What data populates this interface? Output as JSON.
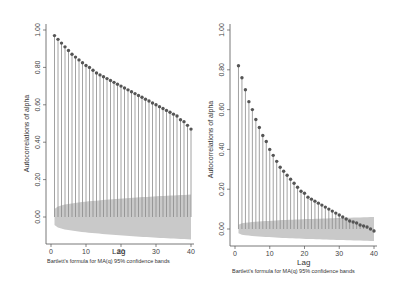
{
  "chart_data": [
    {
      "type": "bar",
      "subtype": "stem (correlogram)",
      "x": [
        1,
        2,
        3,
        4,
        5,
        6,
        7,
        8,
        9,
        10,
        11,
        12,
        13,
        14,
        15,
        16,
        17,
        18,
        19,
        20,
        21,
        22,
        23,
        24,
        25,
        26,
        27,
        28,
        29,
        30,
        31,
        32,
        33,
        34,
        35,
        36,
        37,
        38,
        39,
        40
      ],
      "values": [
        0.97,
        0.95,
        0.93,
        0.91,
        0.89,
        0.87,
        0.855,
        0.84,
        0.825,
        0.81,
        0.8,
        0.785,
        0.77,
        0.76,
        0.75,
        0.74,
        0.73,
        0.72,
        0.71,
        0.7,
        0.69,
        0.68,
        0.67,
        0.66,
        0.65,
        0.64,
        0.63,
        0.62,
        0.61,
        0.6,
        0.59,
        0.58,
        0.57,
        0.56,
        0.55,
        0.54,
        0.52,
        0.51,
        0.49,
        0.47
      ],
      "band_upper_end": 0.12,
      "xlabel": "Lag",
      "ylabel": "Autocorrelations of alpha",
      "note": "Bartlett's formula for MA(q) 95% confidence bands",
      "xticks": [
        "0",
        "10",
        "20",
        "30",
        "40"
      ],
      "yticks": [
        "0.00",
        "0.20",
        "0.40",
        "0.60",
        "0.80",
        "1.00"
      ],
      "xlim": [
        0,
        40
      ],
      "ylim": [
        -0.15,
        1.0
      ]
    },
    {
      "type": "bar",
      "subtype": "stem (correlogram)",
      "x": [
        1,
        2,
        3,
        4,
        5,
        6,
        7,
        8,
        9,
        10,
        11,
        12,
        13,
        14,
        15,
        16,
        17,
        18,
        19,
        20,
        21,
        22,
        23,
        24,
        25,
        26,
        27,
        28,
        29,
        30,
        31,
        32,
        33,
        34,
        35,
        36,
        37,
        38,
        39,
        40
      ],
      "values": [
        0.82,
        0.76,
        0.7,
        0.64,
        0.6,
        0.55,
        0.51,
        0.47,
        0.44,
        0.4,
        0.37,
        0.34,
        0.31,
        0.29,
        0.27,
        0.25,
        0.23,
        0.21,
        0.19,
        0.18,
        0.16,
        0.15,
        0.14,
        0.13,
        0.12,
        0.11,
        0.1,
        0.09,
        0.08,
        0.07,
        0.06,
        0.05,
        0.04,
        0.035,
        0.03,
        0.02,
        0.015,
        0.01,
        0.0,
        -0.01
      ],
      "band_upper_end": 0.06,
      "xlabel": "Lag",
      "ylabel": "Autocorrelations of alpha",
      "note": "Bartlett's formula for MA(q) 95% confidence bands",
      "xticks": [
        "0",
        "10",
        "20",
        "30",
        "40"
      ],
      "yticks": [
        "0.00",
        "0.20",
        "0.40",
        "0.60",
        "0.80",
        "1.00"
      ],
      "xlim": [
        0,
        40
      ],
      "ylim": [
        -0.08,
        1.0
      ]
    }
  ],
  "labels": {
    "xlabel": "Lag",
    "ylabel": "Autocorrelations of alpha",
    "note": "Bartlett's formula for MA(q) 95% confidence bands"
  }
}
